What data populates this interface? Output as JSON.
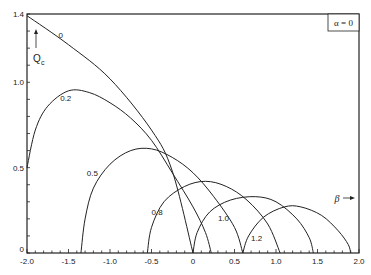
{
  "chart_data": {
    "type": "line",
    "title": "",
    "xlabel": "β",
    "ylabel": "Q_c",
    "xlim": [
      -2.0,
      2.0
    ],
    "ylim": [
      0,
      1.4
    ],
    "grid": false,
    "x_ticks": [
      "-2.0",
      "-1.5",
      "-1.0",
      "-0.5",
      "0",
      "0.5",
      "1.0",
      "1.5",
      "2.0"
    ],
    "y_ticks": [
      "0",
      "0.5",
      "1.0",
      "1.4"
    ],
    "annotation_box": "α = 0",
    "series": [
      {
        "name": "0",
        "label_pos": [
          -1.62,
          1.26
        ],
        "points": [
          [
            -2.0,
            1.39
          ],
          [
            -1.5,
            1.22
          ],
          [
            -1.0,
            1.02
          ],
          [
            -0.5,
            0.72
          ],
          [
            -0.25,
            0.48
          ],
          [
            0.0,
            0.0
          ]
        ]
      },
      {
        "name": "0.2",
        "label_pos": [
          -1.6,
          0.89
        ],
        "points": [
          [
            -2.0,
            0.5
          ],
          [
            -1.9,
            0.72
          ],
          [
            -1.75,
            0.86
          ],
          [
            -1.5,
            0.95
          ],
          [
            -1.25,
            0.94
          ],
          [
            -1.0,
            0.88
          ],
          [
            -0.75,
            0.79
          ],
          [
            -0.5,
            0.66
          ],
          [
            -0.25,
            0.47
          ],
          [
            0.0,
            0.27
          ],
          [
            0.15,
            0.12
          ],
          [
            0.22,
            0.0
          ]
        ]
      },
      {
        "name": "0.5",
        "label_pos": [
          -1.28,
          0.45
        ],
        "points": [
          [
            -1.35,
            0.0
          ],
          [
            -1.3,
            0.2
          ],
          [
            -1.2,
            0.38
          ],
          [
            -1.0,
            0.52
          ],
          [
            -0.75,
            0.6
          ],
          [
            -0.5,
            0.61
          ],
          [
            -0.25,
            0.56
          ],
          [
            0.0,
            0.47
          ],
          [
            0.25,
            0.33
          ],
          [
            0.5,
            0.15
          ],
          [
            0.6,
            0.0
          ]
        ]
      },
      {
        "name": "0.8",
        "label_pos": [
          -0.5,
          0.22
        ],
        "points": [
          [
            -0.55,
            0.0
          ],
          [
            -0.5,
            0.15
          ],
          [
            -0.35,
            0.3
          ],
          [
            -0.1,
            0.39
          ],
          [
            0.15,
            0.42
          ],
          [
            0.4,
            0.39
          ],
          [
            0.65,
            0.31
          ],
          [
            0.9,
            0.17
          ],
          [
            1.05,
            0.0
          ]
        ]
      },
      {
        "name": "1.0",
        "label_pos": [
          0.3,
          0.19
        ],
        "points": [
          [
            0.0,
            0.0
          ],
          [
            0.05,
            0.12
          ],
          [
            0.2,
            0.24
          ],
          [
            0.45,
            0.31
          ],
          [
            0.75,
            0.33
          ],
          [
            1.0,
            0.3
          ],
          [
            1.25,
            0.2
          ],
          [
            1.4,
            0.09
          ],
          [
            1.45,
            0.0
          ]
        ]
      },
      {
        "name": "1.2",
        "label_pos": [
          0.7,
          0.07
        ],
        "points": [
          [
            0.6,
            0.0
          ],
          [
            0.67,
            0.1
          ],
          [
            0.85,
            0.21
          ],
          [
            1.1,
            0.27
          ],
          [
            1.3,
            0.27
          ],
          [
            1.55,
            0.22
          ],
          [
            1.75,
            0.13
          ],
          [
            1.87,
            0.05
          ],
          [
            1.9,
            0.0
          ]
        ]
      }
    ]
  }
}
